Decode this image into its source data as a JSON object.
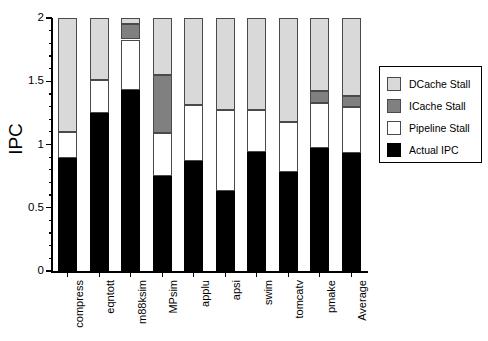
{
  "chart_data": {
    "type": "bar",
    "stacked": true,
    "title": "",
    "xlabel": "",
    "ylabel": "IPC",
    "ylim": [
      0,
      2
    ],
    "ytick_labels": [
      "0",
      "0.5",
      "1",
      "1.5",
      "2"
    ],
    "ytick_values": [
      0,
      0.5,
      1,
      1.5,
      2
    ],
    "minor_tick_step": 0.1,
    "grid": false,
    "legend_position": "right",
    "categories": [
      "compress",
      "eqntott",
      "m88ksim",
      "MPsim",
      "applu",
      "apsi",
      "swim",
      "tomcatv",
      "pmake",
      "Average"
    ],
    "series": [
      {
        "name": "Actual IPC",
        "color": "#000000",
        "values": [
          0.89,
          1.25,
          1.43,
          0.75,
          0.87,
          0.63,
          0.94,
          0.78,
          0.97,
          0.93
        ]
      },
      {
        "name": "Pipeline Stall",
        "color": "#ffffff",
        "values": [
          0.21,
          0.26,
          0.4,
          0.34,
          0.44,
          0.64,
          0.33,
          0.4,
          0.36,
          0.37
        ]
      },
      {
        "name": "ICache Stall",
        "color": "#808080",
        "values": [
          0.0,
          0.0,
          0.12,
          0.46,
          0.0,
          0.0,
          0.0,
          0.0,
          0.09,
          0.08
        ]
      },
      {
        "name": "DCache Stall",
        "color": "#d9d9d9",
        "values": [
          0.9,
          0.49,
          0.05,
          0.45,
          0.69,
          0.73,
          0.73,
          0.82,
          0.58,
          0.62
        ]
      }
    ],
    "cumulative_tops": {
      "actual": [
        0.89,
        1.25,
        1.43,
        0.75,
        0.87,
        0.63,
        0.94,
        0.78,
        0.97,
        0.93
      ],
      "pipeline": [
        1.1,
        1.51,
        1.83,
        1.09,
        1.31,
        1.27,
        1.27,
        1.18,
        1.33,
        1.3
      ],
      "icache": [
        1.1,
        1.51,
        1.95,
        1.55,
        1.31,
        1.27,
        1.27,
        1.18,
        1.42,
        1.38
      ],
      "dcache": [
        2.0,
        2.0,
        2.0,
        2.0,
        2.0,
        2.0,
        2.0,
        2.0,
        2.0,
        2.0
      ]
    }
  },
  "legend": {
    "items": [
      {
        "label": "DCache Stall",
        "key": "dcache"
      },
      {
        "label": "ICache Stall",
        "key": "icache"
      },
      {
        "label": "Pipeline Stall",
        "key": "pipeline"
      },
      {
        "label": "Actual IPC",
        "key": "actual"
      }
    ]
  },
  "colors": {
    "dcache": "#d9d9d9",
    "icache": "#808080",
    "pipeline": "#ffffff",
    "actual": "#000000",
    "axis": "#000000",
    "outline": "#4a4a4a"
  }
}
